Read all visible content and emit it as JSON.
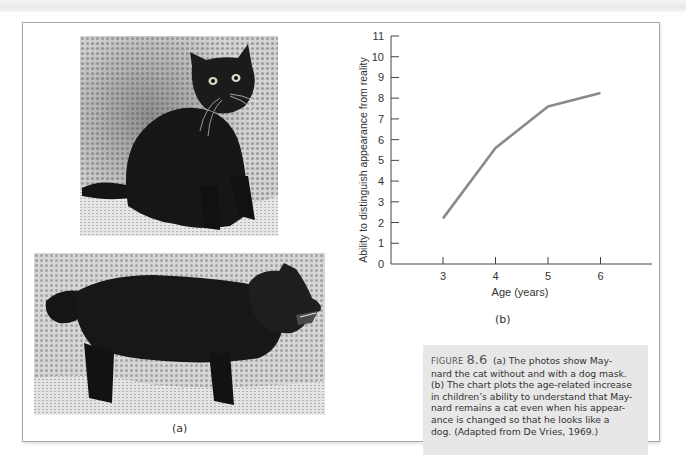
{
  "page": {
    "panel_a_label": "(a)",
    "panel_b_label": "(b)",
    "photos": [
      {
        "description": "Maynard the cat without a mask, sitting on a textured couch"
      },
      {
        "description": "Maynard the cat wearing a dog mask, standing in profile"
      }
    ]
  },
  "caption": {
    "figure_label": "FIGURE",
    "figure_number": "8.6",
    "lines": [
      "(a) The photos show May-",
      "nard the cat without and with a dog mask.",
      "(b) The chart plots the age-related increase",
      "in children’s ability to understand that May-",
      "nard remains a cat even when his appear-",
      "ance is changed so that he looks like a",
      "dog. (Adapted from De Vries, 1969.)"
    ]
  },
  "chart_data": {
    "type": "line",
    "title": "",
    "xlabel": "Age (years)",
    "ylabel": "Ability to distinguish appearance from reality",
    "x": [
      3,
      4,
      5,
      6
    ],
    "categories": [
      "3",
      "4",
      "5",
      "6"
    ],
    "series": [
      {
        "name": "Ability",
        "values": [
          2.2,
          5.6,
          7.6,
          8.25
        ],
        "color": "#8a8a8a"
      }
    ],
    "x_ticks": [
      "3",
      "4",
      "5",
      "6"
    ],
    "y_ticks": [
      "0",
      "1",
      "2",
      "3",
      "4",
      "5",
      "6",
      "7",
      "8",
      "9",
      "10",
      "11"
    ],
    "xlim": [
      2,
      7
    ],
    "ylim": [
      0,
      11
    ],
    "grid": false,
    "legend": "none",
    "panel_label": "(b)"
  }
}
